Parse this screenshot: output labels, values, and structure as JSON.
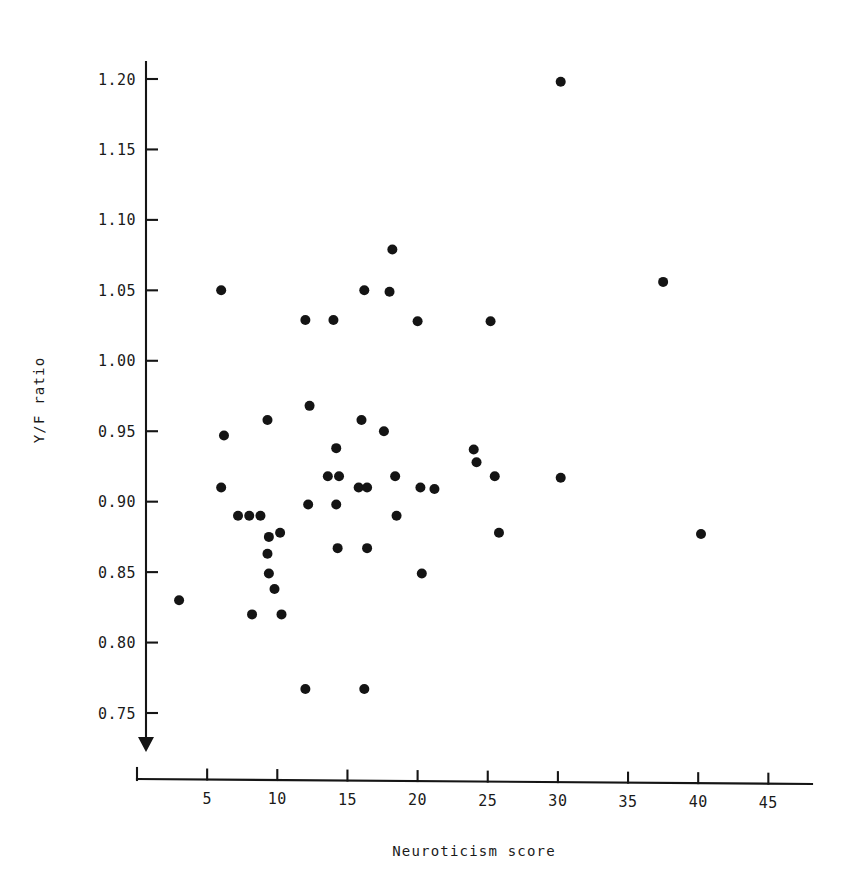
{
  "chart_data": {
    "type": "scatter",
    "title": "",
    "xlabel": "Neuroticism score",
    "ylabel": "Y/F ratio",
    "xlim": [
      0,
      48.5
    ],
    "ylim": [
      0.725,
      1.225
    ],
    "xticks": [
      5,
      10,
      15,
      20,
      25,
      30,
      35,
      40,
      45
    ],
    "xtick_labels": [
      "5",
      "10",
      "15",
      "20",
      "25",
      "30",
      "35",
      "40",
      "45"
    ],
    "yticks": [
      0.75,
      0.8,
      0.85,
      0.9,
      0.95,
      1.0,
      1.05,
      1.1,
      1.15,
      1.2
    ],
    "ytick_labels": [
      "0.75",
      "0.80",
      "0.85",
      "0.90",
      "0.95",
      "1.00",
      "1.05",
      "1.10",
      "1.15",
      "1.20"
    ],
    "grid": false,
    "legend": false,
    "marker": "filled-circle",
    "marker_color": "#141414",
    "marker_size": 5,
    "n_points": 53,
    "points": [
      {
        "x": 3.0,
        "y": 0.83
      },
      {
        "x": 6.0,
        "y": 1.05
      },
      {
        "x": 6.2,
        "y": 0.947
      },
      {
        "x": 6.0,
        "y": 0.91
      },
      {
        "x": 7.2,
        "y": 0.89
      },
      {
        "x": 8.0,
        "y": 0.89
      },
      {
        "x": 8.8,
        "y": 0.89
      },
      {
        "x": 8.2,
        "y": 0.82
      },
      {
        "x": 9.3,
        "y": 0.958
      },
      {
        "x": 9.4,
        "y": 0.875
      },
      {
        "x": 9.3,
        "y": 0.863
      },
      {
        "x": 9.4,
        "y": 0.849
      },
      {
        "x": 9.8,
        "y": 0.838
      },
      {
        "x": 10.2,
        "y": 0.878
      },
      {
        "x": 10.3,
        "y": 0.82
      },
      {
        "x": 12.0,
        "y": 1.029
      },
      {
        "x": 12.3,
        "y": 0.968
      },
      {
        "x": 12.2,
        "y": 0.898
      },
      {
        "x": 12.0,
        "y": 0.767
      },
      {
        "x": 13.6,
        "y": 0.918
      },
      {
        "x": 14.0,
        "y": 1.029
      },
      {
        "x": 14.2,
        "y": 0.938
      },
      {
        "x": 14.4,
        "y": 0.918
      },
      {
        "x": 14.2,
        "y": 0.898
      },
      {
        "x": 14.3,
        "y": 0.867
      },
      {
        "x": 16.0,
        "y": 0.958
      },
      {
        "x": 15.8,
        "y": 0.91
      },
      {
        "x": 16.4,
        "y": 0.91
      },
      {
        "x": 16.4,
        "y": 0.867
      },
      {
        "x": 16.2,
        "y": 0.767
      },
      {
        "x": 16.2,
        "y": 1.05
      },
      {
        "x": 18.2,
        "y": 1.079
      },
      {
        "x": 18.0,
        "y": 1.049
      },
      {
        "x": 17.6,
        "y": 0.95
      },
      {
        "x": 18.4,
        "y": 0.918
      },
      {
        "x": 18.5,
        "y": 0.89
      },
      {
        "x": 20.0,
        "y": 1.028
      },
      {
        "x": 20.2,
        "y": 0.91
      },
      {
        "x": 20.3,
        "y": 0.849
      },
      {
        "x": 21.2,
        "y": 0.909
      },
      {
        "x": 24.0,
        "y": 0.937
      },
      {
        "x": 24.2,
        "y": 0.928
      },
      {
        "x": 25.2,
        "y": 1.028
      },
      {
        "x": 25.5,
        "y": 0.918
      },
      {
        "x": 25.8,
        "y": 0.878
      },
      {
        "x": 30.2,
        "y": 1.198
      },
      {
        "x": 30.2,
        "y": 0.917
      },
      {
        "x": 37.5,
        "y": 1.056
      },
      {
        "x": 40.2,
        "y": 0.877
      }
    ]
  }
}
